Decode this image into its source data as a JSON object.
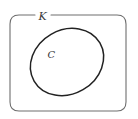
{
  "diagram": {
    "outer_set": {
      "label": "K",
      "shape": "rounded-rectangle",
      "stroke_color": "#6e6e6e"
    },
    "inner_set": {
      "label": "C",
      "shape": "ellipse",
      "stroke_color": "#222222"
    }
  }
}
